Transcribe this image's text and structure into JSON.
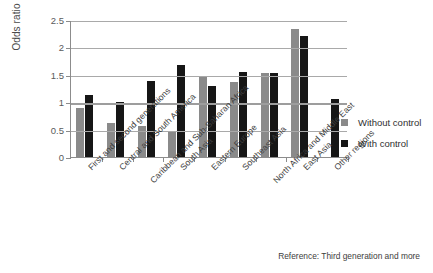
{
  "chart_data": {
    "type": "bar",
    "title": "",
    "xlabel": "",
    "ylabel": "Odds ratio",
    "ylim": [
      0,
      2.5
    ],
    "yticks": [
      "0",
      "0.5",
      "1",
      "1.5",
      "2",
      "2.5"
    ],
    "grid": true,
    "legend_position": "right",
    "reference_note": "Reference: Third generation and more",
    "categories": [
      "First and second generations",
      "Central and South America",
      "Caribbean and Sub-Saharan Africa",
      "South Asia",
      "Eastern Europe",
      "Southeast Asia",
      "North Africa and Middle East",
      "East Asia",
      "Other regions"
    ],
    "series": [
      {
        "name": "Without control",
        "color": "#8a8a8a",
        "values": [
          0.9,
          0.62,
          0.57,
          0.46,
          1.47,
          1.37,
          1.53,
          2.33,
          null
        ]
      },
      {
        "name": "With control",
        "color": "#161616",
        "values": [
          1.13,
          1.0,
          1.38,
          1.68,
          1.3,
          1.55,
          1.53,
          2.2,
          1.05
        ]
      }
    ]
  }
}
